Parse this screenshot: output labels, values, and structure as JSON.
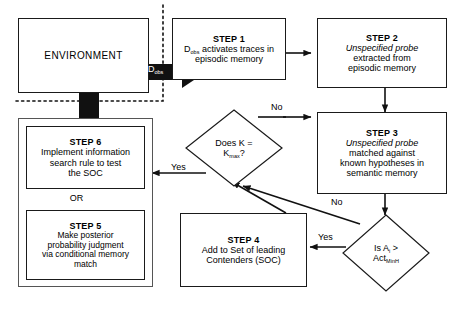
{
  "diagram": {
    "type": "flowchart",
    "nodes": {
      "environment": {
        "label": "ENVIRONMENT",
        "shape": "rectangle"
      },
      "step1": {
        "title": "STEP 1",
        "line1_pre": "D",
        "line1_sub": "obs",
        "line1_post": " activates traces in",
        "line2": "episodic memory",
        "shape": "rectangle"
      },
      "step2": {
        "title": "STEP 2",
        "italic_line": "Unspecified probe",
        "line2": "extracted from",
        "line3": "episodic memory",
        "shape": "rectangle"
      },
      "step3": {
        "title": "STEP 3",
        "italic_line": "Unspecified probe",
        "line2": "matched against",
        "line3": "known hypotheses in",
        "line4": "semantic memory",
        "shape": "rectangle"
      },
      "step4": {
        "title": "STEP 4",
        "line2": "Add to Set of leading",
        "line3": "Contenders (SOC)",
        "shape": "rectangle"
      },
      "step5": {
        "title": "STEP 5",
        "line2": "Make posterior",
        "line3": "probability judgment",
        "line4": "via conditional memory",
        "line5": "match",
        "shape": "rectangle"
      },
      "step6": {
        "title": "STEP 6",
        "line2": "Implement information",
        "line3": "search rule to test",
        "line4": "the SOC",
        "shape": "rectangle"
      },
      "or_connector": {
        "label": "OR"
      },
      "decision_k": {
        "line1_pre": "Does K =",
        "line2_pre": "K",
        "line2_sub": "max",
        "line2_post": "?",
        "shape": "diamond"
      },
      "decision_activation": {
        "line1_pre": "Is A",
        "line1_sub": "i",
        "line1_post": " >",
        "line2_pre": "Act",
        "line2_sub": "MinH",
        "shape": "diamond"
      }
    },
    "edges": {
      "dobs_block_arrow": {
        "label_pre": "D",
        "label_sub": "obs",
        "style": "block-arrow",
        "from": "environment",
        "to": "step1"
      },
      "step1_to_step2": {
        "label": "",
        "from": "step1",
        "to": "step2"
      },
      "step2_to_step3": {
        "label": "",
        "from": "step2",
        "to": "step3"
      },
      "step3_to_decision_activation": {
        "label": "",
        "from": "step3",
        "to": "decision_activation"
      },
      "decision_activation_yes": {
        "label": "Yes",
        "from": "decision_activation",
        "to": "step4"
      },
      "decision_activation_no": {
        "label": "No",
        "from": "decision_activation",
        "to": "decision_k"
      },
      "step4_to_decision_k": {
        "label": "",
        "from": "step4",
        "to": "decision_k"
      },
      "decision_k_no": {
        "label": "No",
        "from": "decision_k",
        "to": "step3"
      },
      "decision_k_yes": {
        "label": "Yes",
        "from": "decision_k",
        "to": "step5_step6_group"
      },
      "step6_to_environment": {
        "label": "",
        "style": "thick-block-arrow",
        "from": "step6",
        "to": "environment"
      }
    },
    "boundary": {
      "style": "dashed",
      "description": "dashed boundary separating environment from internal cognitive processes"
    },
    "colors": {
      "stroke": "#1a1a1a",
      "fill": "#ffffff",
      "text": "#000000",
      "block_arrow": "#000000",
      "block_arrow_text": "#ffffff",
      "group_stroke": "#555555"
    }
  }
}
